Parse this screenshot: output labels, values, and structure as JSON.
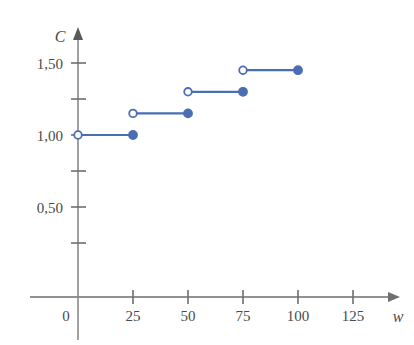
{
  "chart_data": {
    "type": "line",
    "title": "",
    "xlabel": "w",
    "ylabel": "C",
    "xlim": [
      -10,
      135
    ],
    "ylim": [
      0,
      1.65
    ],
    "grid": false,
    "legend": null,
    "x_ticks": [
      0,
      25,
      50,
      75,
      100,
      125
    ],
    "x_tick_labels": [
      "0",
      "25",
      "50",
      "75",
      "100",
      "125"
    ],
    "y_ticks": [
      0.25,
      0.5,
      0.75,
      1.0,
      1.25,
      1.5
    ],
    "y_tick_labels": [
      "",
      "0,50",
      "",
      "1,00",
      "",
      "1,50"
    ],
    "series": [
      {
        "name": "C(w)",
        "style": "step",
        "color": "#4a6db5",
        "steps": [
          {
            "x_start": 0,
            "x_end": 25,
            "y": 1.0,
            "left_marker": "open",
            "right_marker": "filled"
          },
          {
            "x_start": 25,
            "x_end": 50,
            "y": 1.15,
            "left_marker": "open",
            "right_marker": "filled"
          },
          {
            "x_start": 50,
            "x_end": 75,
            "y": 1.3,
            "left_marker": "open",
            "right_marker": "filled"
          },
          {
            "x_start": 75,
            "x_end": 100,
            "y": 1.45,
            "left_marker": "open",
            "right_marker": "filled"
          }
        ]
      }
    ]
  },
  "axes": {
    "y_axis_label": "C",
    "x_axis_label": "w",
    "axis_color": "#6e6e6e",
    "line_color": "#4a6db5"
  },
  "labels": {
    "y": {
      "t150": "1,50",
      "t100": "1,00",
      "t050": "0,50"
    },
    "x": {
      "t0": "0",
      "t25": "25",
      "t50": "50",
      "t75": "75",
      "t100": "100",
      "t125": "125"
    }
  }
}
